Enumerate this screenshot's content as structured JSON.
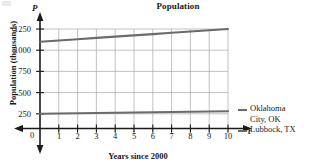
{
  "chart_title": "Population",
  "axis_variable_y": "P",
  "axis_variable_t": "t",
  "ylabel": "Population (thousands)",
  "xlabel": "Years since 2000",
  "origin_label": "0",
  "yticks": [
    "1250",
    "1000",
    "750",
    "500",
    "250"
  ],
  "xticks": [
    "1",
    "2",
    "3",
    "4",
    "5",
    "6",
    "7",
    "8",
    "9",
    "10"
  ],
  "legend": {
    "series1_line1": "Oklahoma",
    "series1_line2": "City, OK",
    "series2": "Lubbock, TX"
  },
  "colors": {
    "line": "#6b6b6b",
    "grid": "#a9a9a9",
    "axis": "#1a1a1a"
  },
  "chart_data": {
    "type": "line",
    "title": "Population",
    "xlabel": "Years since 2000",
    "ylabel": "Population (thousands)",
    "xlim": [
      0,
      10
    ],
    "ylim": [
      0,
      1250
    ],
    "xticks": [
      0,
      1,
      2,
      3,
      4,
      5,
      6,
      7,
      8,
      9,
      10
    ],
    "yticks": [
      250,
      500,
      750,
      1000,
      1250
    ],
    "grid": true,
    "legend_position": "right",
    "x": [
      0,
      1,
      2,
      3,
      4,
      5,
      6,
      7,
      8,
      9,
      10
    ],
    "series": [
      {
        "name": "Oklahoma City, OK",
        "color": "#6b6b6b",
        "values": [
          1100,
          1115,
          1130,
          1145,
          1160,
          1175,
          1190,
          1205,
          1220,
          1235,
          1250
        ]
      },
      {
        "name": "Lubbock, TX",
        "color": "#6b6b6b",
        "values": [
          250,
          253,
          256,
          259,
          262,
          265,
          268,
          271,
          274,
          277,
          280
        ]
      }
    ]
  }
}
